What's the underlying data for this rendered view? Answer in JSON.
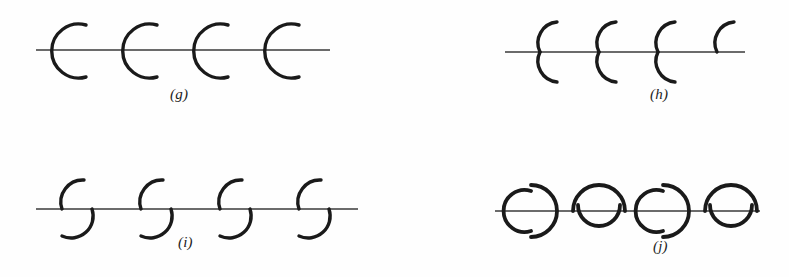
{
  "figure": {
    "background_color": "#fefefe",
    "stroke_color": "#1a1a1a",
    "axis_line_color": "#3a3a3a",
    "width": 789,
    "height": 277
  },
  "panels": [
    {
      "id": "g",
      "caption": "(g)",
      "description": "Row of four large C-shaped arcs opening to the right, each centred on a horizontal straight line",
      "axis": {
        "x1": 36,
        "x2": 330,
        "y": 50
      },
      "element_count": 4,
      "element_type": "c-arc-open-right",
      "element_centers_x": [
        70,
        141,
        212,
        283
      ],
      "arc_radius": 27,
      "stroke_width": 3.4
    },
    {
      "id": "h",
      "caption": "(h)",
      "description": "Row of four paired arcs: an upper arc opening right above the line and a mirrored lower arc below the line, slightly offset to the right",
      "axis": {
        "x1": 505,
        "x2": 745,
        "y": 52
      },
      "element_count": 4,
      "element_type": "offset-arc-pair-small",
      "element_centers_x": [
        533,
        592,
        651,
        710
      ],
      "arc_radius": 21,
      "offset_x": 17,
      "stroke_width": 3.4
    },
    {
      "id": "i",
      "caption": "(i)",
      "description": "Row of four paired arcs like panel h but with a larger horizontal offset between the upper and lower arcs",
      "axis": {
        "x1": 36,
        "x2": 358,
        "y": 209
      },
      "element_count": 4,
      "element_type": "offset-arc-pair-large",
      "element_centers_x": [
        66,
        145,
        224,
        303
      ],
      "arc_radius": 21,
      "offset_x": 26,
      "stroke_width": 3.4
    },
    {
      "id": "j",
      "caption": "(j)",
      "description": "Row of four closed round figures alternating between a broken circle made of two facing C arcs and a circle made of a large upper arc with a small lower arc",
      "axis": {
        "x1": 495,
        "x2": 760,
        "y": 211
      },
      "element_count": 4,
      "element_type": "alternating-circles",
      "element_centers_x": [
        533,
        599,
        665,
        731
      ],
      "variants": [
        "broken-circle",
        "full-circle",
        "broken-circle",
        "full-circle"
      ],
      "arc_radius": 24,
      "stroke_width": 3.8
    }
  ],
  "captions": {
    "g": "(g)",
    "h": "(h)",
    "i": "(i)",
    "j": "(j)"
  }
}
